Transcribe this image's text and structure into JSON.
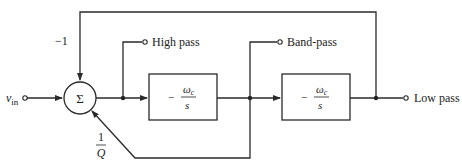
{
  "diagram": {
    "type": "state-variable filter block diagram",
    "input_label": "v",
    "input_subscript": "in",
    "summer_symbol": "Σ",
    "feedback_gain_top": "−1",
    "feedback_gain_bottom_num": "1",
    "feedback_gain_bottom_den": "Q",
    "integrator1": {
      "sign": "−",
      "num": "ω",
      "num_sub": "c",
      "den": "s"
    },
    "integrator2": {
      "sign": "−",
      "num": "ω",
      "num_sub": "c",
      "den": "s"
    },
    "outputs": {
      "high_pass": "High pass",
      "band_pass": "Band-pass",
      "low_pass": "Low pass"
    }
  }
}
